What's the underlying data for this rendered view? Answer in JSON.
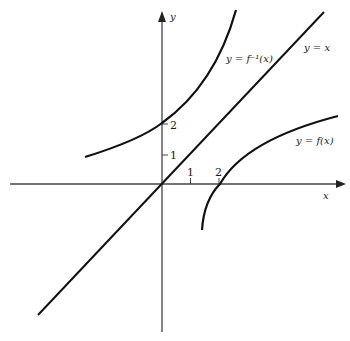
{
  "figure": {
    "axes": {
      "x_label": "x",
      "y_label": "y",
      "x_ticks": [
        {
          "value": 1,
          "label": "1"
        },
        {
          "value": 2,
          "label": "2"
        }
      ],
      "y_ticks": [
        {
          "value": 1,
          "label": "1"
        },
        {
          "value": 2,
          "label": "2"
        }
      ]
    },
    "curves": {
      "inverse_label": "y = f⁻¹(x)",
      "identity_label": "y = x",
      "function_label": "y = f(x)"
    },
    "colors": {
      "stroke": "#111111",
      "axis": "#444444",
      "background": "#ffffff"
    }
  }
}
